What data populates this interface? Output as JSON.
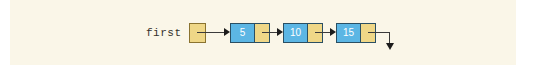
{
  "canvas": {
    "width": 534,
    "height": 65,
    "page_background": "#ffffff",
    "panel_background": "#faf6e8"
  },
  "diagram": {
    "kind": "singly-linked-list",
    "head_pointer": {
      "label": "first",
      "box_name": "head-pointer-box",
      "box_color": "#efd787",
      "box_border_color": "#8a7330"
    },
    "nodes": [
      {
        "value": "5",
        "data_color": "#5cb6e4",
        "pointer_color": "#efd787",
        "border_color": "#2a4f63"
      },
      {
        "value": "10",
        "data_color": "#5cb6e4",
        "pointer_color": "#efd787",
        "border_color": "#2a4f63"
      },
      {
        "value": "15",
        "data_color": "#5cb6e4",
        "pointer_color": "#efd787",
        "border_color": "#2a4f63"
      }
    ],
    "links": [
      {
        "from": "head-pointer-box",
        "to": "node-1",
        "style": "horizontal-arrow"
      },
      {
        "from": "node-1",
        "to": "node-2",
        "style": "horizontal-arrow"
      },
      {
        "from": "node-2",
        "to": "node-3",
        "style": "horizontal-arrow"
      }
    ],
    "terminator": {
      "name": "null-pointer-arrow",
      "style": "right-then-down",
      "meaning": "null"
    },
    "line_color": "#3b3b3b",
    "arrow_color": "#1c1c1c",
    "value_text_color": "#ffffff",
    "label_text_color": "#35312c"
  }
}
